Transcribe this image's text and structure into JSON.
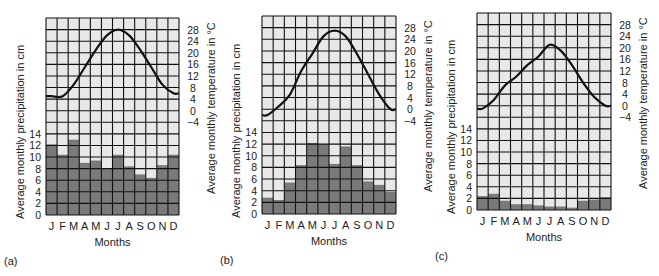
{
  "figure": {
    "x_axis_label": "Months",
    "left_axis_label": "Average monthly precipitation in cm",
    "right_axis_label": "Average monthly temperature in °C",
    "months": [
      "J",
      "F",
      "M",
      "A",
      "M",
      "J",
      "J",
      "A",
      "S",
      "O",
      "N",
      "D"
    ],
    "precip_ticks": [
      "0",
      "2",
      "4",
      "6",
      "8",
      "10",
      "12",
      "14"
    ],
    "temp_ticks": [
      "−4",
      "0",
      "4",
      "8",
      "12",
      "16",
      "20",
      "24",
      "28"
    ],
    "colors": {
      "bar": "#7a7a7a",
      "cell_fill": "#e8e8e8",
      "grid": "#111111",
      "curve": "#111111"
    }
  },
  "chart_data": [
    {
      "type": "bar+line",
      "panel_label": "(a)",
      "title": "",
      "xlabel": "Months",
      "ylabel": "Average monthly precipitation in cm",
      "y2label": "Average monthly temperature in °C",
      "categories": [
        "J",
        "F",
        "M",
        "A",
        "M",
        "J",
        "J",
        "A",
        "S",
        "O",
        "N",
        "D"
      ],
      "series": [
        {
          "name": "Precipitation (cm)",
          "kind": "bar",
          "values": [
            12.2,
            10.4,
            13.0,
            9.0,
            9.4,
            8.0,
            10.4,
            8.4,
            7.0,
            6.4,
            8.6,
            10.4
          ]
        },
        {
          "name": "Temperature (°C)",
          "kind": "line",
          "values": [
            5,
            5,
            9,
            15,
            21,
            26,
            28,
            26,
            21,
            15,
            9,
            6
          ]
        }
      ],
      "ylim": [
        0,
        14
      ],
      "y2lim": [
        -4,
        28
      ],
      "grid": true,
      "legend": "none"
    },
    {
      "type": "bar+line",
      "panel_label": "(b)",
      "title": "",
      "xlabel": "Months",
      "ylabel": "Average monthly precipitation in cm",
      "y2label": "Average monthly temperature in °C",
      "categories": [
        "J",
        "F",
        "M",
        "A",
        "M",
        "J",
        "J",
        "A",
        "S",
        "O",
        "N",
        "D"
      ],
      "series": [
        {
          "name": "Precipitation (cm)",
          "kind": "bar",
          "values": [
            2.8,
            2.4,
            5.4,
            8.4,
            12.2,
            12.0,
            8.6,
            11.6,
            8.4,
            5.6,
            5.0,
            3.8
          ]
        },
        {
          "name": "Temperature (°C)",
          "kind": "line",
          "values": [
            -2,
            1,
            5,
            13,
            19,
            25,
            27,
            25,
            19,
            12,
            5,
            0
          ]
        }
      ],
      "ylim": [
        0,
        14
      ],
      "y2lim": [
        -4,
        28
      ],
      "grid": true,
      "legend": "none"
    },
    {
      "type": "bar+line",
      "panel_label": "(c)",
      "title": "",
      "xlabel": "Months",
      "ylabel": "Average monthly precipitation in cm",
      "y2label": "Average monthly temperature in °C",
      "categories": [
        "J",
        "F",
        "M",
        "A",
        "M",
        "J",
        "J",
        "A",
        "S",
        "O",
        "N",
        "D"
      ],
      "series": [
        {
          "name": "Precipitation (cm)",
          "kind": "bar",
          "values": [
            2.4,
            2.8,
            1.6,
            1.0,
            1.0,
            0.8,
            0.6,
            0.6,
            0.4,
            1.6,
            1.8,
            2.2
          ]
        },
        {
          "name": "Temperature (°C)",
          "kind": "line",
          "values": [
            -1,
            2,
            7,
            10,
            14,
            17,
            21,
            19,
            14,
            8,
            3,
            0
          ]
        }
      ],
      "ylim": [
        0,
        14
      ],
      "y2lim": [
        -4,
        28
      ],
      "grid": true,
      "legend": "none"
    }
  ]
}
